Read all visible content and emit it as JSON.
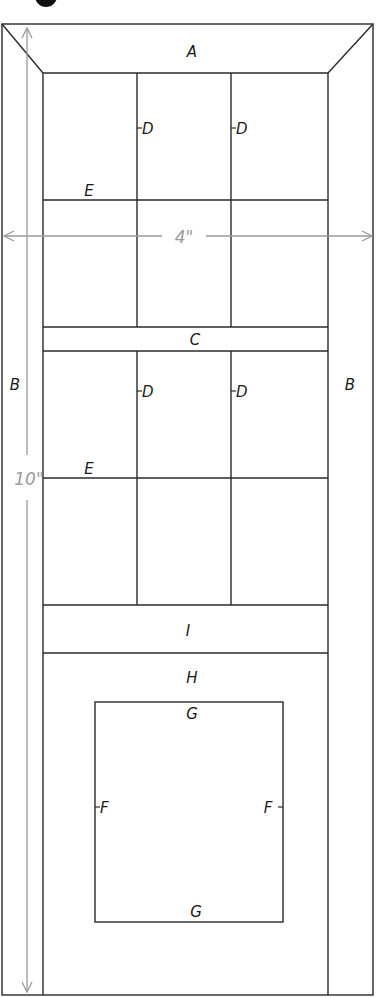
{
  "diagram": {
    "step_badge": "4",
    "labels": {
      "top_rail": "A",
      "left_stile": "B",
      "right_stile": "B",
      "middle_rail": "C",
      "upper_muntin_left": "D",
      "upper_muntin_right": "D",
      "lower_muntin_left": "D",
      "lower_muntin_right": "D",
      "upper_cross_muntin": "E",
      "lower_cross_muntin": "E",
      "lower_rail": "I",
      "bottom_panel": "H",
      "panel_top_trim": "G",
      "panel_bottom_trim": "G",
      "panel_left_trim": "F",
      "panel_right_trim": "F"
    },
    "dimensions": {
      "width": "4\"",
      "height": "10\""
    },
    "colors": {
      "line": "#2a2a2a",
      "dimension": "#9a9a9a",
      "badge": "#111111"
    }
  }
}
